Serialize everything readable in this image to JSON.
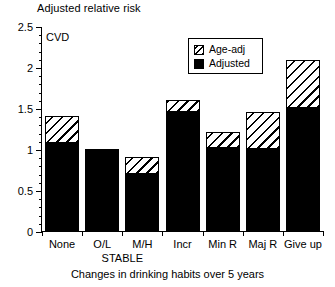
{
  "chart_data": {
    "type": "bar",
    "title": "",
    "ylabel": "Adjusted relative risk",
    "xlabel": "Changes in drinking habits over 5 years",
    "annotation": "CVD",
    "group_label": "STABLE",
    "categories": [
      "None",
      "O/L",
      "M/H",
      "Incr",
      "Min R",
      "Maj R",
      "Give up"
    ],
    "ylim": [
      0,
      2.5
    ],
    "ytick_labels": [
      "0",
      "0.5",
      "1",
      "1.5",
      "2",
      "2.5"
    ],
    "ytick_values": [
      0,
      0.5,
      1,
      1.5,
      2,
      2.5
    ],
    "yminor_step": 0.1,
    "grid": false,
    "stacked": true,
    "legend_position": "upper-center",
    "series": [
      {
        "name": "Adjusted",
        "style": "solid",
        "color": "#000000",
        "values": [
          1.08,
          1.01,
          0.71,
          1.46,
          1.03,
          1.01,
          1.51
        ]
      },
      {
        "name": "Age-adj",
        "style": "hatched",
        "color": "#ffffff",
        "values": [
          1.42,
          1.01,
          0.91,
          1.61,
          1.22,
          1.46,
          2.1
        ]
      }
    ]
  },
  "legend": {
    "items": [
      {
        "label": "Age-adj",
        "swatch": "hatch"
      },
      {
        "label": "Adjusted",
        "swatch": "solid"
      }
    ]
  }
}
